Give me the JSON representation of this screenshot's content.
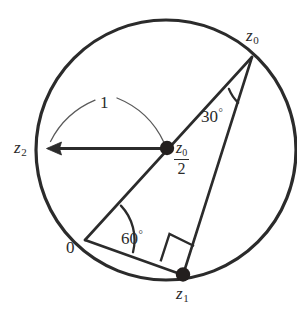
{
  "figure": {
    "stroke_color": "#2b2b2b",
    "background_color": "#ffffff",
    "labels": {
      "z0": "z",
      "z0_sub": "0",
      "z1": "z",
      "z1_sub": "1",
      "z2": "z",
      "z2_sub": "2",
      "origin": "0",
      "radius": "1",
      "angle_top": "30",
      "angle_top_unit": "°",
      "angle_bottom": "60",
      "angle_bottom_unit": "°",
      "center_numerator": "z",
      "center_numerator_sub": "0",
      "center_denominator": "2"
    },
    "geometry": {
      "circle": {
        "cx": 166,
        "cy": 150,
        "r": 130
      },
      "points": {
        "z0": {
          "x": 252,
          "y": 57
        },
        "z1": {
          "x": 183,
          "y": 275
        },
        "z2": {
          "x": 47,
          "y": 148
        },
        "origin": {
          "x": 85,
          "y": 240
        },
        "center": {
          "x": 167,
          "y": 148
        }
      },
      "angles": {
        "top": 30,
        "bottom": 60,
        "right_angle": 90
      },
      "radius_value": 1
    }
  }
}
